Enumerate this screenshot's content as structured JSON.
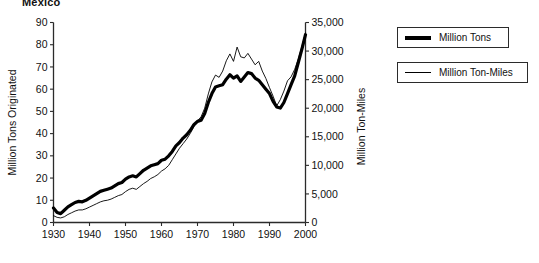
{
  "chart_data": {
    "type": "line",
    "title": "Mexico",
    "xlabel": "",
    "ylabel": "Million Tons Originated",
    "y2label": "Million Ton-Miles",
    "xlim": [
      1930,
      2000
    ],
    "ylim": [
      0,
      90
    ],
    "y2lim": [
      0,
      35000
    ],
    "grid": false,
    "legend_position": "right-outside",
    "x_ticks": [
      "1930",
      "1940",
      "1950",
      "1960",
      "1970",
      "1980",
      "1990",
      "2000"
    ],
    "x_tick_values": [
      1930,
      1940,
      1950,
      1960,
      1970,
      1980,
      1990,
      2000
    ],
    "y_ticks": [
      "0",
      "10",
      "20",
      "30",
      "40",
      "50",
      "60",
      "70",
      "80",
      "90"
    ],
    "y_tick_values": [
      0,
      10,
      20,
      30,
      40,
      50,
      60,
      70,
      80,
      90
    ],
    "y2_ticks": [
      "0",
      "5,000",
      "10,000",
      "15,000",
      "20,000",
      "25,000",
      "30,000",
      "35,000"
    ],
    "y2_tick_values": [
      0,
      5000,
      10000,
      15000,
      20000,
      25000,
      30000,
      35000
    ],
    "x": [
      1930,
      1931,
      1932,
      1933,
      1934,
      1935,
      1936,
      1937,
      1938,
      1939,
      1940,
      1941,
      1942,
      1943,
      1944,
      1945,
      1946,
      1947,
      1948,
      1949,
      1950,
      1951,
      1952,
      1953,
      1954,
      1955,
      1956,
      1957,
      1958,
      1959,
      1960,
      1961,
      1962,
      1963,
      1964,
      1965,
      1966,
      1967,
      1968,
      1969,
      1970,
      1971,
      1972,
      1973,
      1974,
      1975,
      1976,
      1977,
      1978,
      1979,
      1980,
      1981,
      1982,
      1983,
      1984,
      1985,
      1986,
      1987,
      1988,
      1989,
      1990,
      1991,
      1992,
      1993,
      1994,
      1995,
      1996,
      1997,
      1998,
      1999,
      2000
    ],
    "series": [
      {
        "name": "Million Tons",
        "axis": "left",
        "line_width": 3.2,
        "color": "#000000",
        "values": [
          6.5,
          4.5,
          4.0,
          5.5,
          7.0,
          8.0,
          9.0,
          9.5,
          9.3,
          10.0,
          11.0,
          12.0,
          13.0,
          14.0,
          14.5,
          15.0,
          15.5,
          16.5,
          17.5,
          18.0,
          19.5,
          20.5,
          21.0,
          20.5,
          22.0,
          23.5,
          24.5,
          25.5,
          26.0,
          26.5,
          28.0,
          28.5,
          30.0,
          32.0,
          34.5,
          36.0,
          38.0,
          39.5,
          41.5,
          44.0,
          45.5,
          46.0,
          49.0,
          54.0,
          58.0,
          61.0,
          61.5,
          62.0,
          64.5,
          66.5,
          65.0,
          66.0,
          63.5,
          65.5,
          67.5,
          67.0,
          65.0,
          64.0,
          62.0,
          60.0,
          58.0,
          54.5,
          52.0,
          51.5,
          54.0,
          58.0,
          62.0,
          66.0,
          72.0,
          78.0,
          84.5
        ]
      },
      {
        "name": "Million Ton-Miles",
        "axis": "right",
        "line_width": 0.9,
        "color": "#000000",
        "values": [
          1200,
          900,
          800,
          1000,
          1400,
          1700,
          2000,
          2200,
          2200,
          2400,
          2700,
          3000,
          3300,
          3600,
          3800,
          3900,
          4100,
          4400,
          4700,
          4900,
          5400,
          5800,
          6000,
          5800,
          6300,
          6800,
          7200,
          7700,
          8000,
          8400,
          9000,
          9400,
          10000,
          11000,
          12000,
          13000,
          13800,
          14600,
          15600,
          16800,
          17800,
          18500,
          20000,
          22500,
          24600,
          25800,
          25400,
          26500,
          28300,
          29500,
          28200,
          30700,
          29000,
          28800,
          29600,
          28600,
          27600,
          28200,
          26500,
          25200,
          23600,
          22100,
          20400,
          21500,
          23000,
          24800,
          25500,
          26800,
          28600,
          30800,
          33200
        ]
      }
    ]
  },
  "legend": {
    "items": [
      {
        "label": "Million Tons",
        "style": "thick"
      },
      {
        "label": "Million Ton-Miles",
        "style": "thin"
      }
    ]
  }
}
